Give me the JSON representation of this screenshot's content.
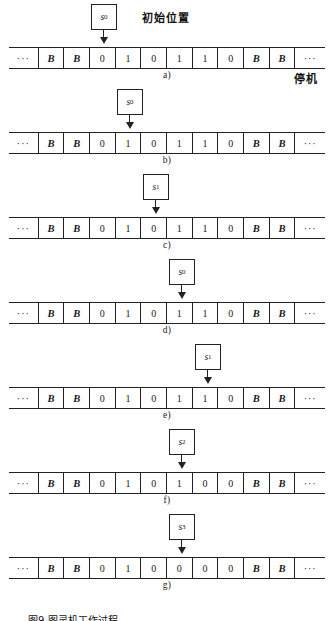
{
  "figure": {
    "title_initial_position": "初始位置",
    "halt_label": "停机",
    "caption": "图9  图灵机工作过程",
    "blank_symbol": "B",
    "ellipsis": "···"
  },
  "chart_data": {
    "type": "table",
    "xlabel": "",
    "ylabel": "",
    "annotations": [
      "初始位置",
      "停机"
    ],
    "columns": [
      "c0",
      "c1",
      "c2",
      "c3",
      "c4",
      "c5",
      "c6",
      "c7",
      "c8",
      "c9",
      "c10",
      "c11"
    ],
    "steps": [
      {
        "label": "a)",
        "state": "s",
        "state_sub": "0",
        "head_index": 3,
        "cells": [
          "···",
          "B",
          "B",
          "0",
          "1",
          "0",
          "1",
          "1",
          "0",
          "B",
          "B",
          "···"
        ]
      },
      {
        "label": "b)",
        "state": "s",
        "state_sub": "0",
        "head_index": 4,
        "cells": [
          "···",
          "B",
          "B",
          "0",
          "1",
          "0",
          "1",
          "1",
          "0",
          "B",
          "B",
          "···"
        ]
      },
      {
        "label": "c)",
        "state": "s",
        "state_sub": "1",
        "head_index": 5,
        "cells": [
          "···",
          "B",
          "B",
          "0",
          "1",
          "0",
          "1",
          "1",
          "0",
          "B",
          "B",
          "···"
        ]
      },
      {
        "label": "d)",
        "state": "s",
        "state_sub": "0",
        "head_index": 6,
        "cells": [
          "···",
          "B",
          "B",
          "0",
          "1",
          "0",
          "1",
          "1",
          "0",
          "B",
          "B",
          "···"
        ]
      },
      {
        "label": "e)",
        "state": "s",
        "state_sub": "1",
        "head_index": 7,
        "cells": [
          "···",
          "B",
          "B",
          "0",
          "1",
          "0",
          "1",
          "1",
          "0",
          "B",
          "B",
          "···"
        ]
      },
      {
        "label": "f)",
        "state": "s",
        "state_sub": "2",
        "head_index": 6,
        "cells": [
          "···",
          "B",
          "B",
          "0",
          "1",
          "0",
          "1",
          "0",
          "0",
          "B",
          "B",
          "···"
        ]
      },
      {
        "label": "g)",
        "state": "s",
        "state_sub": "3",
        "head_index": 6,
        "cells": [
          "···",
          "B",
          "B",
          "0",
          "1",
          "0",
          "0",
          "0",
          "0",
          "B",
          "B",
          "···"
        ]
      }
    ]
  }
}
